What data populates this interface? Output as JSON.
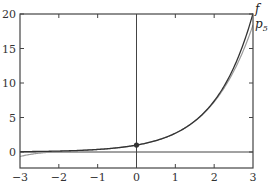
{
  "chart_data": {
    "type": "line",
    "title": "",
    "xlabel": "",
    "ylabel": "",
    "xlim": [
      -3,
      3
    ],
    "ylim": [
      -2.3,
      20
    ],
    "grid": false,
    "x_ticks": [
      -3,
      -2,
      -1,
      0,
      1,
      2,
      3
    ],
    "y_ticks": [
      0,
      5,
      10,
      15,
      20
    ],
    "x_tick_labels": [
      "−3",
      "−2",
      "−1",
      "0",
      "1",
      "2",
      "3"
    ],
    "y_tick_labels": [
      "0",
      "5",
      "10",
      "15",
      "20"
    ],
    "series": [
      {
        "name": "f",
        "description": "exp(x)",
        "color": "#333333",
        "x": [
          -3,
          -2.5,
          -2,
          -1.5,
          -1,
          -0.5,
          0,
          0.5,
          1,
          1.5,
          2,
          2.5,
          3
        ],
        "values": [
          0.05,
          0.08,
          0.14,
          0.22,
          0.37,
          0.61,
          1.0,
          1.65,
          2.72,
          4.48,
          7.39,
          12.18,
          20.09
        ]
      },
      {
        "name": "p5",
        "description": "degree-5 Taylor polynomial of exp(x) at 0",
        "color": "#999999",
        "x": [
          -3,
          -2.5,
          -2,
          -1.5,
          -1,
          -0.5,
          0,
          0.5,
          1,
          1.5,
          2,
          2.5,
          3
        ],
        "values": [
          -0.65,
          -0.07,
          0.07,
          0.22,
          0.37,
          0.61,
          1.0,
          1.65,
          2.72,
          4.48,
          7.27,
          11.74,
          18.4
        ]
      }
    ],
    "annotations": [
      {
        "type": "point",
        "x": 0,
        "y": 1,
        "label": ""
      },
      {
        "type": "label",
        "text": "f",
        "near": "right end of f curve"
      },
      {
        "type": "label",
        "text": "p",
        "subscript": "5",
        "near": "right end of p5 curve"
      }
    ],
    "reference_lines": [
      {
        "axis": "y",
        "value": 0
      },
      {
        "axis": "x",
        "value": 0
      }
    ],
    "legend_position": "inline-right"
  },
  "labels": {
    "f": "f",
    "p_main": "p",
    "p_sub": "5"
  },
  "colors": {
    "frame": "#444444",
    "f": "#333333",
    "p5": "#9a9a9a",
    "dot": "#333333"
  }
}
